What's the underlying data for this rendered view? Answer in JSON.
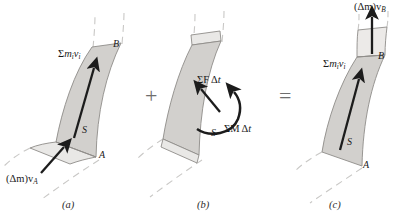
{
  "figure": {
    "type": "physics-diagram",
    "background": "#ffffff",
    "colors": {
      "fluid_fill": "#d2d0cd",
      "fluid_fill_light": "#e9e8e6",
      "outline": "#8c8a87",
      "arrow": "#1c1c1c",
      "dashed_streamline": "#c9c8c6",
      "operator": "#6e6e6e",
      "text": "#1a1a1a"
    }
  },
  "operators": {
    "plus": "+",
    "equals": "="
  },
  "panels": [
    {
      "id": "a",
      "caption": "(a)",
      "caption_x": 63,
      "caption_y": 203,
      "labels": {
        "momentum": {
          "prefix": "Σ",
          "base": "m",
          "sub1": "i",
          "base2": "v",
          "sub2": "i",
          "x": 60,
          "y": 51
        },
        "section_B": {
          "text": "B",
          "x": 114,
          "y": 44
        },
        "section_S": {
          "text": "S",
          "x": 83,
          "y": 130
        },
        "section_A": {
          "text": "A",
          "x": 100,
          "y": 155
        },
        "inflow": {
          "text": "(Δm)v",
          "sub": "A",
          "x": 8,
          "y": 176
        }
      },
      "arrows": [
        {
          "name": "momentum-arrow",
          "x1": 74,
          "y1": 138,
          "x2": 93,
          "y2": 67
        },
        {
          "name": "inflow-arrow",
          "x1": 41,
          "y1": 172,
          "x2": 64,
          "y2": 146
        }
      ]
    },
    {
      "id": "b",
      "caption": "(b)",
      "caption_x": 198,
      "caption_y": 203,
      "labels": {
        "force_impulse": {
          "prefix": "Σ",
          "base": "F",
          "delta": "Δ",
          "base2": "t",
          "x": 198,
          "y": 77
        },
        "moment_impulse": {
          "prefix": "Σ",
          "base": "M",
          "delta": "Δ",
          "base2": "t",
          "x": 225,
          "y": 126
        },
        "section_S": {
          "text": "S",
          "x": 213,
          "y": 133
        }
      },
      "arrows": [
        {
          "name": "force-arrow",
          "x1": 220,
          "y1": 110,
          "x2": 201,
          "y2": 88
        }
      ],
      "curved_arrow": {
        "name": "moment-arrow"
      }
    },
    {
      "id": "c",
      "caption": "(c)",
      "caption_x": 330,
      "caption_y": 203,
      "labels": {
        "outflow": {
          "text": "(Δm)v",
          "sub": "B",
          "x": 355,
          "y": 4
        },
        "momentum": {
          "prefix": "Σ",
          "base": "m",
          "sub1": "i",
          "base2": "v",
          "sub2": "i",
          "x": 325,
          "y": 61
        },
        "section_B": {
          "text": "B",
          "x": 379,
          "y": 56
        },
        "section_S": {
          "text": "S",
          "x": 348,
          "y": 142
        },
        "section_A": {
          "text": "A",
          "x": 364,
          "y": 165
        }
      },
      "arrows": [
        {
          "name": "momentum-arrow",
          "x1": 340,
          "y1": 149,
          "x2": 358,
          "y2": 78
        },
        {
          "name": "outflow-arrow",
          "x1": 372,
          "y1": 53,
          "x2": 372,
          "y2": 16
        }
      ]
    }
  ]
}
